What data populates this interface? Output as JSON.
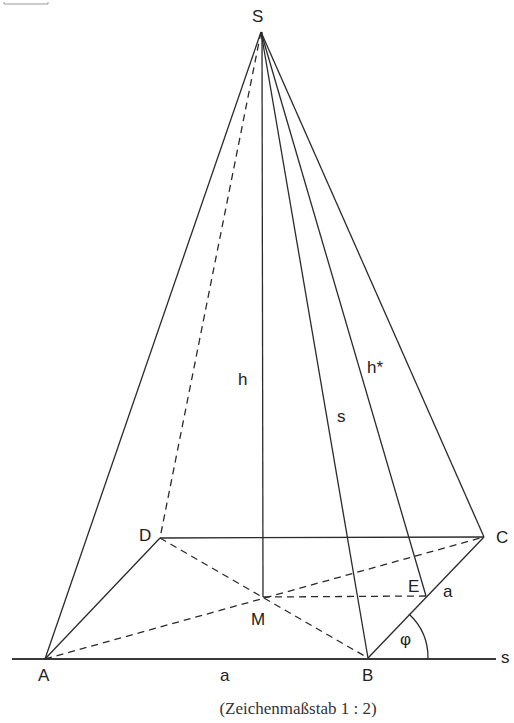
{
  "figure": {
    "caption": "(Zeichenmaßstab 1 : 2)",
    "top_fragment": "",
    "points": {
      "S": {
        "label": "S",
        "x": 261,
        "y": 32
      },
      "A": {
        "label": "A",
        "x": 45,
        "y": 659
      },
      "B": {
        "label": "B",
        "x": 368,
        "y": 658
      },
      "C": {
        "label": "C",
        "x": 484,
        "y": 537
      },
      "D": {
        "label": "D",
        "x": 160,
        "y": 538
      },
      "M": {
        "label": "M",
        "x": 263,
        "y": 597
      },
      "E": {
        "label": "E",
        "x": 426,
        "y": 596
      }
    },
    "segment_labels": {
      "h": "h",
      "h_star": "h*",
      "s_edge": "s",
      "a_base": "a",
      "a_side": "a",
      "phi": "φ",
      "s_line": "s"
    },
    "colors": {
      "line": "#2a2a2a",
      "text": "#222222",
      "background": "#ffffff"
    }
  }
}
